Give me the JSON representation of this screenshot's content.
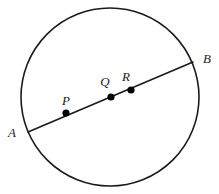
{
  "figure": {
    "kind": "geometry-diagram",
    "canvas": {
      "width": 219,
      "height": 194,
      "background": "#ffffff"
    },
    "colors": {
      "stroke": "#1a1a1a",
      "point_fill": "#000000",
      "background": "#ffffff"
    },
    "circle": {
      "name": "circle",
      "center_x": 110,
      "center_y": 97,
      "radius": 89,
      "stroke_width": 1.6
    },
    "chord": {
      "name": "chord-AB",
      "x1": 28,
      "y1": 132,
      "x2": 193,
      "y2": 62,
      "stroke_width": 1.6
    },
    "points": [
      {
        "id": "A",
        "label": "A",
        "x": 28,
        "y": 132,
        "dot": false,
        "label_x": 12,
        "label_y": 137
      },
      {
        "id": "P",
        "label": "P",
        "x": 66,
        "y": 113,
        "dot": true,
        "label_x": 66,
        "label_y": 105,
        "dot_r": 3.6
      },
      {
        "id": "Q",
        "label": "Q",
        "x": 111,
        "y": 97,
        "dot": true,
        "label_x": 105,
        "label_y": 86,
        "dot_r": 3.6
      },
      {
        "id": "R",
        "label": "R",
        "x": 131,
        "y": 90,
        "dot": true,
        "label_x": 126,
        "label_y": 81,
        "dot_r": 3.6
      },
      {
        "id": "B",
        "label": "B",
        "x": 193,
        "y": 62,
        "dot": false,
        "label_x": 207,
        "label_y": 63
      }
    ]
  }
}
